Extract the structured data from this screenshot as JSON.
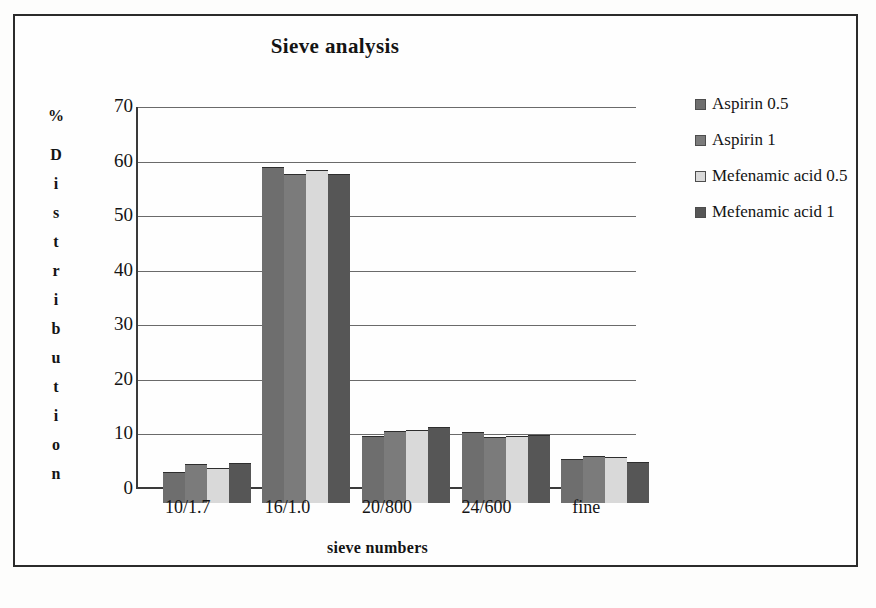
{
  "chart_data": {
    "type": "bar",
    "title": "Sieve analysis",
    "xlabel": "sieve numbers",
    "ylabel": "% Distribution",
    "ylabel_prefix": "%",
    "ylabel_stacked": [
      "D",
      "i",
      "s",
      "t",
      "r",
      "i",
      "b",
      "u",
      "t",
      "i",
      "o",
      "n"
    ],
    "categories": [
      "10/1.7",
      "16/1.0",
      "20/800",
      "24/600",
      "fine"
    ],
    "ylim": [
      0,
      70
    ],
    "yticks": [
      0,
      10,
      20,
      30,
      40,
      50,
      60,
      70
    ],
    "grid": true,
    "legend_position": "right",
    "series": [
      {
        "name": "Aspirin 0.5",
        "color": "#6e6e6e",
        "values": [
          5.7,
          61.5,
          12.3,
          13.0,
          8.0
        ]
      },
      {
        "name": "Aspirin 1",
        "color": "#7b7b7b",
        "values": [
          7.1,
          60.2,
          13.2,
          12.1,
          8.6
        ]
      },
      {
        "name": "Mefenamic acid 0.5",
        "color": "#d9d9d9",
        "values": [
          6.4,
          61.0,
          13.4,
          12.2,
          8.5
        ]
      },
      {
        "name": "Mefenamic acid 1",
        "color": "#565656",
        "values": [
          7.3,
          60.3,
          14.0,
          12.5,
          7.5
        ]
      }
    ]
  },
  "legend": {
    "entries": [
      {
        "label": "Aspirin 0.5",
        "color": "#6e6e6e"
      },
      {
        "label": "Aspirin 1",
        "color": "#7b7b7b"
      },
      {
        "label": "Mefenamic acid 0.5",
        "color": "#d9d9d9"
      },
      {
        "label": "Mefenamic acid 1",
        "color": "#565656"
      }
    ]
  }
}
